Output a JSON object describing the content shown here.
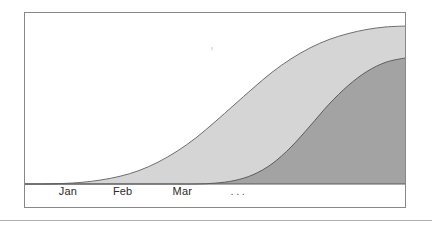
{
  "figure": {
    "title": "",
    "background_color": "#ffffff",
    "frame_color": "#888888",
    "baseline_color": "#5a5a5a",
    "bottom_rule_color": "#b0b0b0"
  },
  "axis": {
    "tick_labels": [
      {
        "text": "Jan",
        "x_pct": 11.3
      },
      {
        "text": "Feb",
        "x_pct": 25.7
      },
      {
        "text": "Mar",
        "x_pct": 41.4
      },
      {
        "text": "...",
        "x_pct": 56.3
      }
    ]
  },
  "series_labels": {
    "back": "light-gray-curve",
    "front": "dark-gray-curve"
  },
  "chart_data": {
    "type": "area",
    "title": "",
    "xlabel": "",
    "ylabel": "",
    "grid": false,
    "legend": "none",
    "xlim": [
      0,
      100
    ],
    "ylim": [
      0,
      100
    ],
    "x_tick_labels": [
      "Jan",
      "Feb",
      "Mar",
      "..."
    ],
    "x_tick_positions": [
      11.3,
      25.7,
      41.4,
      56.3
    ],
    "x": [
      0,
      5,
      10,
      15,
      20,
      25,
      30,
      35,
      40,
      45,
      50,
      55,
      60,
      65,
      70,
      75,
      80,
      85,
      90,
      95,
      100
    ],
    "series": [
      {
        "name": "light-gray-curve",
        "color": "#d5d5d5",
        "stroke": "#6e6e6e",
        "values": [
          0,
          0,
          0.3,
          1.0,
          2.4,
          4.6,
          8.0,
          13.0,
          19.5,
          27.5,
          37.0,
          47.0,
          57.0,
          66.5,
          74.5,
          81.0,
          86.0,
          89.5,
          92.0,
          93.5,
          94.0
        ]
      },
      {
        "name": "dark-gray-curve",
        "color": "#a3a3a3",
        "stroke": "#5c5c5c",
        "values": [
          0,
          0,
          0,
          0,
          0,
          0,
          0,
          0,
          0,
          0,
          0.5,
          2.0,
          5.5,
          12.0,
          22.0,
          34.5,
          47.5,
          58.5,
          67.0,
          72.5,
          75.0
        ]
      }
    ]
  }
}
